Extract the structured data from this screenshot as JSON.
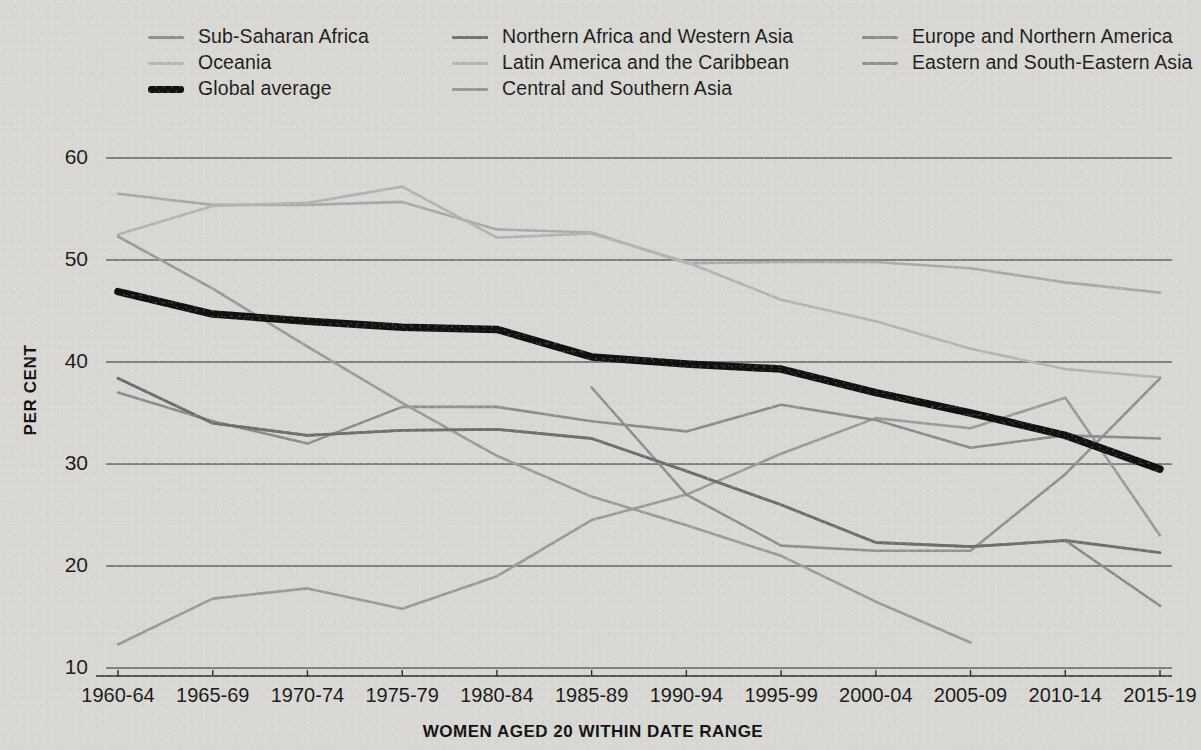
{
  "chart_data": {
    "type": "line",
    "title": "",
    "xlabel": "WOMEN AGED 20 WITHIN DATE RANGE",
    "ylabel": "PER CENT",
    "ylim": [
      10,
      60
    ],
    "yticks": [
      10,
      20,
      30,
      40,
      50,
      60
    ],
    "grid": true,
    "legend_position": "top",
    "categories": [
      "1960-64",
      "1965-69",
      "1970-74",
      "1975-79",
      "1980-84",
      "1985-89",
      "1990-94",
      "1995-99",
      "2000-04",
      "2005-09",
      "2010-14",
      "2015-19"
    ],
    "series": [
      {
        "name": "Sub-Saharan Africa",
        "color": "#8c8c8c",
        "width": 2.6,
        "values": [
          37.0,
          34.2,
          32.0,
          35.6,
          35.6,
          34.2,
          33.2,
          35.8,
          34.3,
          31.6,
          32.8,
          32.5
        ]
      },
      {
        "name": "Oceania",
        "color": "#a9a9a9",
        "width": 2.6,
        "values": [
          56.5,
          55.4,
          55.4,
          55.7,
          53.0,
          52.7,
          49.7,
          49.8,
          49.8,
          49.2,
          47.8,
          46.8
        ]
      },
      {
        "name": "Global average",
        "color": "#111111",
        "width": 7.5,
        "values": [
          46.9,
          44.7,
          44.0,
          43.4,
          43.2,
          40.5,
          39.8,
          39.3,
          37.0,
          35.0,
          32.8,
          29.5
        ]
      },
      {
        "name": "Northern Africa and Western Asia",
        "color": "#6e6e6e",
        "width": 2.8,
        "values": [
          38.4,
          34.0,
          32.8,
          33.3,
          33.4,
          32.5,
          29.3,
          26.0,
          22.3,
          21.9,
          22.5,
          21.3
        ]
      },
      {
        "name": "Latin America and the Caribbean",
        "color": "#b3b3b3",
        "width": 2.6,
        "values": [
          52.5,
          55.3,
          55.6,
          57.2,
          52.2,
          52.6,
          49.8,
          46.1,
          44.0,
          41.3,
          39.3,
          38.5
        ]
      },
      {
        "name": "Central and Southern Asia",
        "color": "#9a9a9a",
        "width": 2.6,
        "values": [
          52.3,
          47.2,
          41.5,
          36.0,
          30.8,
          26.8,
          24.0,
          21.0,
          16.5,
          12.5,
          null,
          null
        ]
      },
      {
        "name": "Europe and Northern America",
        "color": "#8a8a8a",
        "width": 2.6,
        "values": [
          38.4,
          34.0,
          32.8,
          33.3,
          33.4,
          32.5,
          29.3,
          26.0,
          22.3,
          21.9,
          22.5,
          16.1
        ]
      },
      {
        "name": "Eastern and South-Eastern Asia",
        "color": "#8f8f8f",
        "width": 2.6,
        "values": [
          null,
          null,
          null,
          null,
          null,
          37.5,
          27.0,
          22.0,
          21.5,
          21.5,
          29.0,
          38.4
        ]
      }
    ],
    "rising_series_note": {
      "name": "Sub-Saharan Africa (rising branch)",
      "values": [
        12.3,
        16.8,
        17.8,
        15.8,
        19.0,
        24.5,
        27.0,
        31.0,
        34.5,
        33.5,
        36.5,
        23.0
      ]
    }
  },
  "legend": {
    "columns": [
      {
        "items": [
          {
            "label": "Sub-Saharan Africa",
            "color": "#8c8c8c",
            "bold": false
          },
          {
            "label": "Oceania",
            "color": "#b5b5b5",
            "bold": false
          },
          {
            "label": "Global average",
            "color": "#111111",
            "bold": true
          }
        ]
      },
      {
        "items": [
          {
            "label": "Northern Africa and Western Asia",
            "color": "#6e6e6e",
            "bold": false
          },
          {
            "label": "Latin America and the Caribbean",
            "color": "#b3b3b3",
            "bold": false
          },
          {
            "label": "Central and Southern Asia",
            "color": "#9a9a9a",
            "bold": false
          }
        ]
      },
      {
        "items": [
          {
            "label": "Europe and Northern America",
            "color": "#8a8a8a",
            "bold": false
          },
          {
            "label": "Eastern and South-Eastern Asia",
            "color": "#8f8f8f",
            "bold": false
          }
        ]
      }
    ]
  },
  "axes": {
    "y_title": "PER CENT",
    "x_title": "WOMEN AGED 20 WITHIN DATE RANGE"
  }
}
